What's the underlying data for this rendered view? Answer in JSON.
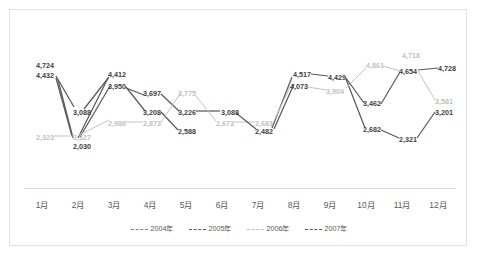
{
  "chart_data": {
    "type": "line",
    "title": "",
    "xlabel": "",
    "ylabel": "",
    "grid": false,
    "legend_position": "bottom",
    "categories": [
      "1月",
      "2月",
      "3月",
      "4月",
      "5月",
      "6月",
      "7月",
      "8月",
      "9月",
      "10月",
      "11月",
      "12月"
    ],
    "ylim": [
      1800,
      5000
    ],
    "series": [
      {
        "name": "2004年",
        "color": "#595959",
        "values": [
          4724,
          3088,
          4412,
          3697,
          3226,
          3088,
          2482,
          4517,
          4429,
          3462,
          4654,
          4728
        ]
      },
      {
        "name": "2005年",
        "color": "#595959",
        "values": [
          4432,
          2030,
          3950,
          3208,
          2588,
          2482,
          2482,
          4517,
          4429,
          2682,
          2321,
          3201
        ]
      },
      {
        "name": "2006年",
        "color": "#bfbfbf",
        "values": [
          2323,
          2327,
          2986,
          2873,
          3775,
          2673,
          2681,
          4073,
          3904,
          4861,
          4718,
          3581
        ]
      },
      {
        "name": "2007年",
        "color": "#595959",
        "values": [
          4432,
          2327,
          3950,
          3208,
          3226,
          3088,
          2482,
          4517,
          4429,
          3462,
          4654,
          3201
        ]
      }
    ],
    "point_labels": [
      {
        "text": "4,724",
        "tone": "dark",
        "x": 26,
        "y": 52
      },
      {
        "text": "4,432",
        "tone": "dark",
        "x": 26,
        "y": 62
      },
      {
        "text": "2,323",
        "tone": "light",
        "x": 26,
        "y": 124
      },
      {
        "text": "3,088",
        "tone": "dark",
        "x": 63,
        "y": 99
      },
      {
        "text": "2,327",
        "tone": "light",
        "x": 63,
        "y": 124
      },
      {
        "text": "2,030",
        "tone": "dark",
        "x": 63,
        "y": 133
      },
      {
        "text": "4,412",
        "tone": "dark",
        "x": 98,
        "y": 61
      },
      {
        "text": "3,950",
        "tone": "dark",
        "x": 98,
        "y": 73
      },
      {
        "text": "2,986",
        "tone": "light",
        "x": 98,
        "y": 110
      },
      {
        "text": "3,697",
        "tone": "dark",
        "x": 133,
        "y": 80
      },
      {
        "text": "3,208",
        "tone": "dark",
        "x": 133,
        "y": 99
      },
      {
        "text": "2,873",
        "tone": "light",
        "x": 133,
        "y": 110
      },
      {
        "text": "3,775",
        "tone": "light",
        "x": 168,
        "y": 80
      },
      {
        "text": "3,226",
        "tone": "dark",
        "x": 168,
        "y": 99
      },
      {
        "text": "2,588",
        "tone": "dark",
        "x": 168,
        "y": 118
      },
      {
        "text": "3,088",
        "tone": "dark",
        "x": 211,
        "y": 99
      },
      {
        "text": "2,673",
        "tone": "light",
        "x": 206,
        "y": 110
      },
      {
        "text": "2,681",
        "tone": "light",
        "x": 245,
        "y": 110
      },
      {
        "text": "2,482",
        "tone": "dark",
        "x": 245,
        "y": 118
      },
      {
        "text": "4,517",
        "tone": "dark",
        "x": 283,
        "y": 61
      },
      {
        "text": "4,073",
        "tone": "dark",
        "x": 280,
        "y": 73
      },
      {
        "text": "4,429",
        "tone": "dark",
        "x": 318,
        "y": 64
      },
      {
        "text": "3,904",
        "tone": "light",
        "x": 316,
        "y": 78
      },
      {
        "text": "4,861",
        "tone": "light",
        "x": 356,
        "y": 52
      },
      {
        "text": "3,462",
        "tone": "dark",
        "x": 353,
        "y": 90
      },
      {
        "text": "2,682",
        "tone": "dark",
        "x": 353,
        "y": 116
      },
      {
        "text": "4,718",
        "tone": "light",
        "x": 392,
        "y": 42
      },
      {
        "text": "4,654",
        "tone": "dark",
        "x": 389,
        "y": 58
      },
      {
        "text": "2,321",
        "tone": "dark",
        "x": 389,
        "y": 126
      },
      {
        "text": "4,728",
        "tone": "dark",
        "x": 428,
        "y": 55
      },
      {
        "text": "3,581",
        "tone": "light",
        "x": 425,
        "y": 88
      },
      {
        "text": "3,201",
        "tone": "dark",
        "x": 425,
        "y": 99
      }
    ],
    "connectors": [
      {
        "tone": "dark",
        "x1": 46,
        "y1": 66,
        "x2": 64,
        "y2": 97
      },
      {
        "tone": "dark",
        "x1": 46,
        "y1": 68,
        "x2": 62,
        "y2": 126
      },
      {
        "tone": "dark",
        "x1": 48,
        "y1": 70,
        "x2": 63,
        "y2": 128
      },
      {
        "tone": "light",
        "x1": 44,
        "y1": 126,
        "x2": 64,
        "y2": 126
      },
      {
        "tone": "dark",
        "x1": 68,
        "y1": 128,
        "x2": 98,
        "y2": 68
      },
      {
        "tone": "dark",
        "x1": 70,
        "y1": 127,
        "x2": 100,
        "y2": 76
      },
      {
        "tone": "dark",
        "x1": 74,
        "y1": 99,
        "x2": 99,
        "y2": 67
      },
      {
        "tone": "light",
        "x1": 69,
        "y1": 125,
        "x2": 99,
        "y2": 110
      },
      {
        "tone": "light",
        "x1": 115,
        "y1": 112,
        "x2": 133,
        "y2": 112
      },
      {
        "tone": "dark",
        "x1": 116,
        "y1": 78,
        "x2": 134,
        "y2": 85
      },
      {
        "tone": "dark",
        "x1": 116,
        "y1": 77,
        "x2": 135,
        "y2": 101
      },
      {
        "tone": "dark",
        "x1": 151,
        "y1": 84,
        "x2": 169,
        "y2": 101
      },
      {
        "tone": "dark",
        "x1": 151,
        "y1": 102,
        "x2": 168,
        "y2": 120
      },
      {
        "tone": "light",
        "x1": 151,
        "y1": 112,
        "x2": 170,
        "y2": 84
      },
      {
        "tone": "dark",
        "x1": 186,
        "y1": 101,
        "x2": 210,
        "y2": 101
      },
      {
        "tone": "light",
        "x1": 186,
        "y1": 86,
        "x2": 206,
        "y2": 111
      },
      {
        "tone": "light",
        "x1": 224,
        "y1": 112,
        "x2": 245,
        "y2": 112
      },
      {
        "tone": "dark",
        "x1": 226,
        "y1": 103,
        "x2": 246,
        "y2": 119
      },
      {
        "tone": "dark",
        "x1": 262,
        "y1": 118,
        "x2": 282,
        "y2": 67
      },
      {
        "tone": "light",
        "x1": 262,
        "y1": 115,
        "x2": 280,
        "y2": 77
      },
      {
        "tone": "dark",
        "x1": 264,
        "y1": 119,
        "x2": 284,
        "y2": 74
      },
      {
        "tone": "dark",
        "x1": 301,
        "y1": 64,
        "x2": 318,
        "y2": 66
      },
      {
        "tone": "light",
        "x1": 298,
        "y1": 77,
        "x2": 316,
        "y2": 80
      },
      {
        "tone": "dark",
        "x1": 336,
        "y1": 69,
        "x2": 355,
        "y2": 118
      },
      {
        "tone": "light",
        "x1": 336,
        "y1": 78,
        "x2": 356,
        "y2": 58
      },
      {
        "tone": "dark",
        "x1": 336,
        "y1": 68,
        "x2": 354,
        "y2": 93
      },
      {
        "tone": "light",
        "x1": 373,
        "y1": 56,
        "x2": 390,
        "y2": 61
      },
      {
        "tone": "dark",
        "x1": 371,
        "y1": 94,
        "x2": 390,
        "y2": 62
      },
      {
        "tone": "dark",
        "x1": 371,
        "y1": 120,
        "x2": 389,
        "y2": 128
      },
      {
        "tone": "dark",
        "x1": 408,
        "y1": 60,
        "x2": 428,
        "y2": 58
      },
      {
        "tone": "light",
        "x1": 408,
        "y1": 61,
        "x2": 425,
        "y2": 90
      },
      {
        "tone": "dark",
        "x1": 407,
        "y1": 128,
        "x2": 425,
        "y2": 102
      }
    ]
  },
  "legend": {
    "items": [
      {
        "label": "2004年",
        "color": "#808080"
      },
      {
        "label": "2005年",
        "color": "#595959"
      },
      {
        "label": "2006年",
        "color": "#bfbfbf"
      },
      {
        "label": "2007年",
        "color": "#595959"
      }
    ]
  }
}
